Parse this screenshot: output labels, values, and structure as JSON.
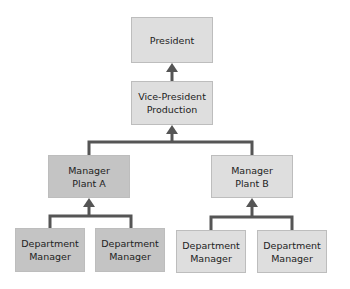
{
  "diagram": {
    "type": "org-chart",
    "colors": {
      "light_box": "#dedede",
      "dark_box": "#c4c4c4",
      "connector": "#555555"
    },
    "nodes": {
      "president": {
        "line1": "President",
        "line2": ""
      },
      "vp": {
        "line1": "Vice-President",
        "line2": "Production"
      },
      "manager_a": {
        "line1": "Manager",
        "line2": "Plant A"
      },
      "manager_b": {
        "line1": "Manager",
        "line2": "Plant B"
      },
      "dept_a1": {
        "line1": "Department",
        "line2": "Manager"
      },
      "dept_a2": {
        "line1": "Department",
        "line2": "Manager"
      },
      "dept_b1": {
        "line1": "Department",
        "line2": "Manager"
      },
      "dept_b2": {
        "line1": "Department",
        "line2": "Manager"
      }
    }
  }
}
